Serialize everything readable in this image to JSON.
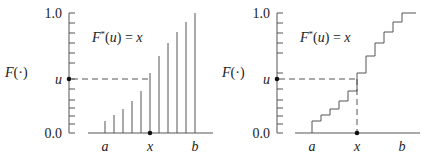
{
  "left_panel": {
    "y_label": "F(·)",
    "y_top": "1.0",
    "y_bottom": "0.0",
    "u_label": "u",
    "formula": "F*(u) = x",
    "x_labels": [
      "a",
      "x",
      "b"
    ],
    "bar_tops_y": [
      121,
      115,
      109,
      101,
      91,
      73,
      56,
      43,
      32,
      22,
      13
    ],
    "bar_x": [
      105,
      114,
      123,
      132,
      141,
      150,
      159,
      168,
      177,
      186,
      195
    ]
  },
  "right_panel": {
    "y_label": "F(·)",
    "y_top": "1.0",
    "y_bottom": "0.0",
    "u_label": "u",
    "formula": "F*(u) = x",
    "x_labels": [
      "a",
      "x",
      "b"
    ]
  },
  "colors": {
    "line": "#555555",
    "text": "#222222"
  }
}
